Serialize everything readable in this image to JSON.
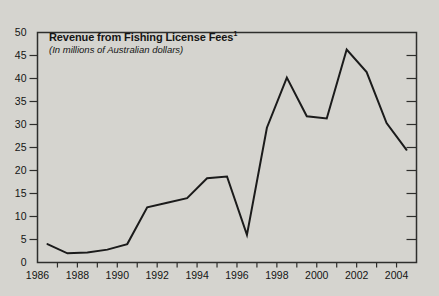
{
  "figure": {
    "title": "Revenue from Fishing License Fees",
    "title_footnote_marker": "1",
    "subtitle": "(In millions of Australian dollars)"
  },
  "colors": {
    "background": "#d5d4cf",
    "line": "#1b1b1b",
    "frame": "#2e2e2c",
    "tick": "#2e2e2c",
    "text": "#141414"
  },
  "chart_data": {
    "type": "line",
    "title": "Revenue from Fishing License Fees",
    "title_footnote_marker": "1",
    "subtitle": "(In millions of Australian dollars)",
    "x": [
      1986,
      1987,
      1988,
      1989,
      1990,
      1991,
      1992,
      1993,
      1994,
      1995,
      1996,
      1997,
      1998,
      1999,
      2000,
      2001,
      2002,
      2003,
      2004
    ],
    "values": [
      4,
      2,
      2.2,
      2.8,
      4,
      12,
      13,
      14,
      18.3,
      18.7,
      6,
      29.3,
      40.2,
      31.8,
      31.3,
      46.3,
      41.4,
      30.3,
      24.5
    ],
    "x_plot_offset": 0.5,
    "xlim": [
      1986,
      2005
    ],
    "ylim": [
      0,
      50
    ],
    "x_tick_labels": [
      "1986",
      "1988",
      "1990",
      "1992",
      "1994",
      "1996",
      "1998",
      "2000",
      "2002",
      "2004"
    ],
    "y_tick_labels": [
      "0",
      "5",
      "10",
      "15",
      "20",
      "25",
      "30",
      "35",
      "40",
      "45",
      "50"
    ],
    "x_minor_tick_interval": 1,
    "y_tick_interval": 5,
    "grid": false,
    "legend": "none",
    "frame": "box"
  }
}
